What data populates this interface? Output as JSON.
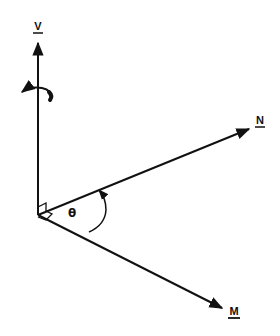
{
  "diagram": {
    "axes": [
      {
        "id": "v",
        "label": "V",
        "underlined": true
      },
      {
        "id": "n",
        "label": "N",
        "underlined": true
      },
      {
        "id": "m",
        "label": "M",
        "underlined": true
      }
    ],
    "angle": {
      "symbol": "θ",
      "between": [
        "N",
        "M"
      ]
    },
    "rotation_arrow": {
      "about": "V",
      "direction": "counterclockwise-view"
    },
    "right_angle_markers": 2,
    "colors": {
      "stroke": "#111111",
      "background": "#ffffff"
    }
  }
}
